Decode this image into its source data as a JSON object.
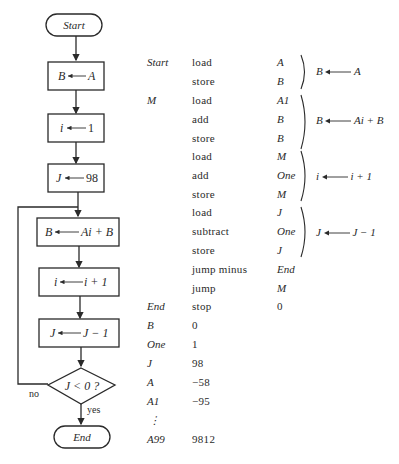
{
  "flowchart": {
    "start": "Start",
    "steps": [
      {
        "lhs": "B",
        "rhs": "A"
      },
      {
        "lhs": "i",
        "rhs": "1"
      },
      {
        "lhs": "J",
        "rhs": "98"
      },
      {
        "lhs": "B",
        "rhs": "Ai + B"
      },
      {
        "lhs": "i",
        "rhs": "i + 1"
      },
      {
        "lhs": "J",
        "rhs": "J − 1"
      }
    ],
    "decision": "J < 0 ?",
    "no_label": "no",
    "yes_label": "yes",
    "end": "End"
  },
  "program": {
    "rows": [
      {
        "label": "Start",
        "op": "load",
        "arg": "A",
        "arg_italic": true
      },
      {
        "label": "",
        "op": "store",
        "arg": "B",
        "arg_italic": true
      },
      {
        "label": "M",
        "op": "load",
        "arg": "A1",
        "arg_italic": true
      },
      {
        "label": "",
        "op": "add",
        "arg": "B",
        "arg_italic": true
      },
      {
        "label": "",
        "op": "store",
        "arg": "B",
        "arg_italic": true
      },
      {
        "label": "",
        "op": "load",
        "arg": "M",
        "arg_italic": true
      },
      {
        "label": "",
        "op": "add",
        "arg": "One",
        "arg_italic": true
      },
      {
        "label": "",
        "op": "store",
        "arg": "M",
        "arg_italic": true
      },
      {
        "label": "",
        "op": "load",
        "arg": "J",
        "arg_italic": true
      },
      {
        "label": "",
        "op": "subtract",
        "arg": "One",
        "arg_italic": true
      },
      {
        "label": "",
        "op": "store",
        "arg": "J",
        "arg_italic": true
      },
      {
        "label": "",
        "op": "jump minus",
        "arg": "End",
        "arg_italic": true
      },
      {
        "label": "",
        "op": "jump",
        "arg": "M",
        "arg_italic": true
      },
      {
        "label": "End",
        "op": "stop",
        "arg": "0",
        "arg_italic": false
      },
      {
        "label": "B",
        "op": "0",
        "arg": "",
        "arg_italic": false
      },
      {
        "label": "One",
        "op": "1",
        "arg": "",
        "arg_italic": false
      },
      {
        "label": "J",
        "op": "98",
        "arg": "",
        "arg_italic": false
      },
      {
        "label": "A",
        "op": "−58",
        "arg": "",
        "arg_italic": false
      },
      {
        "label": "A1",
        "op": "−95",
        "arg": "",
        "arg_italic": false
      },
      {
        "label": "⋮",
        "op": "",
        "arg": "",
        "arg_italic": false
      },
      {
        "label": "A99",
        "op": "9812",
        "arg": "",
        "arg_italic": false
      }
    ],
    "annotations": [
      {
        "lhs": "B",
        "rhs": "A"
      },
      {
        "lhs": "B",
        "rhs": "Ai + B"
      },
      {
        "lhs": "i",
        "rhs": "i + 1"
      },
      {
        "lhs": "J",
        "rhs": "J − 1"
      }
    ]
  }
}
